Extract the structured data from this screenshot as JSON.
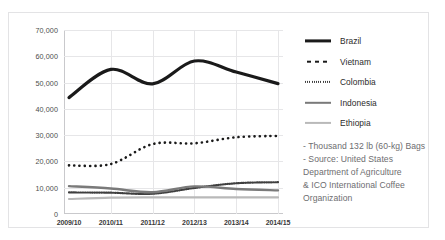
{
  "chart_data": {
    "type": "line",
    "title": "",
    "xlabel": "",
    "ylabel": "",
    "ylim": [
      0,
      70000
    ],
    "ytick_step": 10000,
    "grid": true,
    "legend_position": "right",
    "categories": [
      "2009/10",
      "2010/11",
      "2011/12",
      "2012/13",
      "2013/14",
      "2014/15"
    ],
    "ytick_labels": [
      "70,000",
      "60,000",
      "50,000",
      "40,000",
      "30,000",
      "20,000",
      "10,000",
      "0"
    ],
    "ytick_values": [
      70000,
      60000,
      50000,
      40000,
      30000,
      20000,
      10000,
      0
    ],
    "series": [
      {
        "name": "Brazil",
        "style": "solid",
        "color": "#1a1a1a",
        "width": 3.2,
        "values": [
          44300,
          55000,
          49500,
          58200,
          54000,
          49600
        ]
      },
      {
        "name": "Vietnam",
        "style": "dotted",
        "color": "#1a1a1a",
        "width": 2.6,
        "values": [
          18500,
          19000,
          26600,
          26900,
          29200,
          29700
        ]
      },
      {
        "name": "Colombia",
        "style": "fine-dotted",
        "color": "#3f3f3f",
        "width": 2.2,
        "values": [
          8200,
          8100,
          7700,
          9900,
          11700,
          12100
        ]
      },
      {
        "name": "Indonesia",
        "style": "solid",
        "color": "#7a7a7a",
        "width": 2.4,
        "values": [
          10600,
          9700,
          8300,
          10500,
          9500,
          9000
        ]
      },
      {
        "name": "Ethiopia",
        "style": "solid",
        "color": "#b9b9b9",
        "width": 2.2,
        "values": [
          5700,
          6200,
          6300,
          6300,
          6300,
          6300
        ]
      }
    ]
  },
  "legend": {
    "items": [
      {
        "label": "Brazil"
      },
      {
        "label": "Vietnam"
      },
      {
        "label": "Colombia"
      },
      {
        "label": "Indonesia"
      },
      {
        "label": "Ethiopia"
      }
    ]
  },
  "notes": {
    "line1": "- Thousand 132 lb (60-kg) Bags",
    "line2": "- Source: United States",
    "line3": "Department of Agriculture",
    "line4": "& ICO International Coffee",
    "line5": "Organization"
  }
}
